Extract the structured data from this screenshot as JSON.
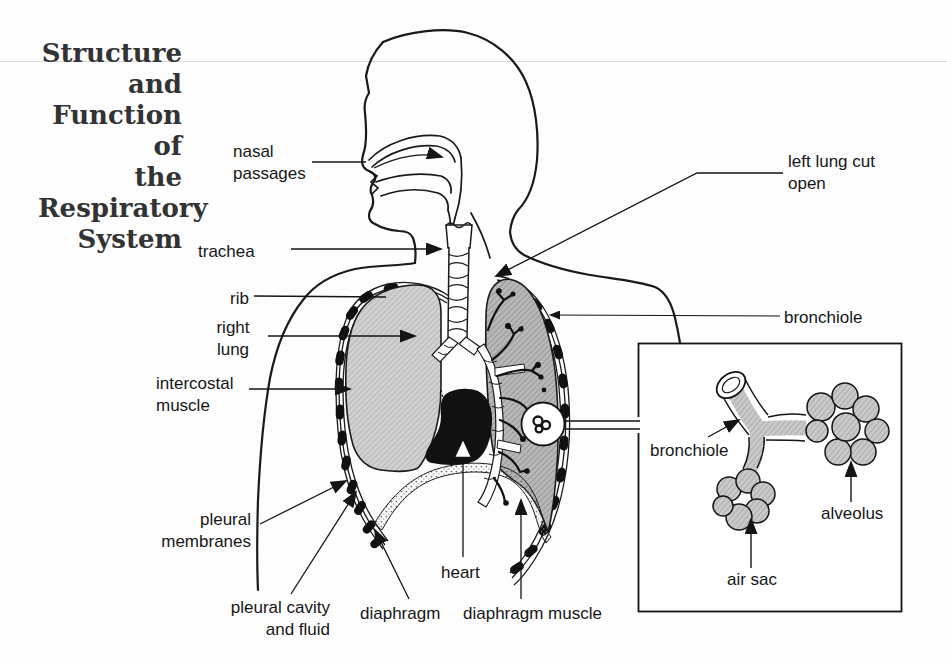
{
  "title": {
    "lines": [
      "Structure",
      "and",
      "Function of",
      "the",
      "Respiratory",
      "System"
    ]
  },
  "diagram": {
    "labels": {
      "nasal_passages": "nasal passages",
      "trachea": "trachea",
      "rib": "rib",
      "right_lung": "right lung",
      "intercostal_muscle": "intercostal muscle",
      "pleural_membranes": "pleural membranes",
      "pleural_cavity_fluid": "pleural cavity and fluid",
      "diaphragm": "diaphragm",
      "heart": "heart",
      "diaphragm_muscle": "diaphragm muscle",
      "left_lung_cut_open": "left lung cut open",
      "bronchiole": "bronchiole",
      "inset_bronchiole": "bronchiole",
      "alveolus": "alveolus",
      "air_sac": "air sac"
    },
    "colors": {
      "line": "#1a1a1a",
      "right_lung_fill": "#cdcdcd",
      "left_lung_fill": "#b4b4b4",
      "text": "#161616",
      "rule": "#d9d9d9"
    }
  }
}
